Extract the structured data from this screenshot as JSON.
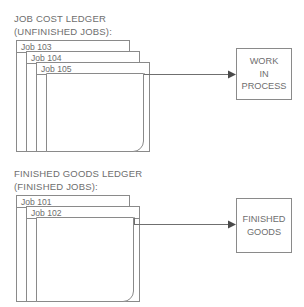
{
  "diagram": {
    "sections": [
      {
        "heading_line1": "JOB COST LEDGER",
        "heading_line2": "(UNFINISHED JOBS):",
        "cards": [
          {
            "label": "Job 103"
          },
          {
            "label": "Job 104"
          },
          {
            "label": "Job 105"
          },
          {
            "label": ""
          }
        ],
        "account_box": {
          "lines": [
            "WORK",
            "IN",
            "PROCESS"
          ]
        }
      },
      {
        "heading_line1": "FINISHED GOODS LEDGER",
        "heading_line2": "(FINISHED JOBS):",
        "cards": [
          {
            "label": "Job 101"
          },
          {
            "label": "Job 102"
          },
          {
            "label": ""
          }
        ],
        "account_box": {
          "lines": [
            "FINISHED",
            "GOODS"
          ]
        }
      }
    ],
    "colors": {
      "stroke": "#8a8a8a",
      "text": "#6e6e6e",
      "arrow": "#6f6f6f",
      "background": "#ffffff"
    }
  }
}
